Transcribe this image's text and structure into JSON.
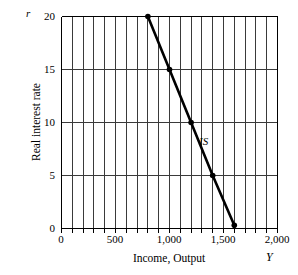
{
  "chart_data": {
    "type": "line",
    "title": "",
    "xlabel": "Income, Output",
    "ylabel": "Real interest rate",
    "x_var_symbol": "Y",
    "y_var_symbol": "r",
    "xlim": [
      0,
      2000
    ],
    "ylim": [
      0,
      20
    ],
    "xticks": [
      0,
      500,
      1000,
      1500,
      2000
    ],
    "xtick_labels": [
      "0",
      "500",
      "1,000",
      "1,500",
      "2,000"
    ],
    "yticks": [
      0,
      5,
      10,
      15,
      20
    ],
    "ytick_labels": [
      "0",
      "5",
      "10",
      "15",
      "20"
    ],
    "grid": {
      "vertical": true,
      "vertical_step": 100,
      "horizontal": true,
      "horizontal_step": 5,
      "color": "#3a3a3a"
    },
    "legend_position": "inline-annotation",
    "series": [
      {
        "name": "IS",
        "label": "IS",
        "color": "#000000",
        "x": [
          800,
          1000,
          1200,
          1400,
          1600
        ],
        "y": [
          20,
          15,
          10,
          5,
          0.3
        ],
        "markers": [
          {
            "x": 800,
            "y": 20
          },
          {
            "x": 1000,
            "y": 15
          },
          {
            "x": 1200,
            "y": 10
          },
          {
            "x": 1400,
            "y": 5
          },
          {
            "x": 1600,
            "y": 0.3
          }
        ],
        "annotation": {
          "text": "IS",
          "x": 1290,
          "y": 7.4
        }
      }
    ]
  },
  "axes": {
    "y_symbol": "r",
    "y_title": "Real interest rate",
    "x_title": "Income, Output",
    "x_symbol": "Y",
    "y_labels": [
      "20",
      "15",
      "10",
      "5",
      "0"
    ],
    "x_labels": [
      "0",
      "500",
      "1,000",
      "1,500",
      "2,000"
    ]
  },
  "series_labels": {
    "is_curve": "IS"
  }
}
